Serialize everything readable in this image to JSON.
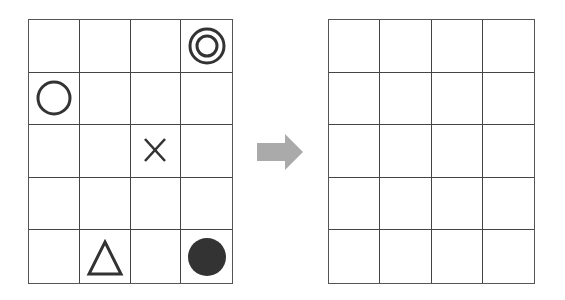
{
  "diagram": {
    "left_grid": {
      "rows": 5,
      "cols": 4,
      "symbols": [
        {
          "row": 0,
          "col": 3,
          "shape": "double-circle"
        },
        {
          "row": 1,
          "col": 0,
          "shape": "circle"
        },
        {
          "row": 2,
          "col": 2,
          "shape": "cross"
        },
        {
          "row": 4,
          "col": 1,
          "shape": "triangle"
        },
        {
          "row": 4,
          "col": 3,
          "shape": "filled-circle"
        }
      ]
    },
    "arrow": {
      "direction": "right",
      "color": "#aaaaaa"
    },
    "right_grid": {
      "rows": 5,
      "cols": 4,
      "symbols": []
    },
    "colors": {
      "line": "#444444",
      "symbol": "#333333",
      "arrow": "#aaaaaa",
      "background": "#ffffff"
    }
  }
}
